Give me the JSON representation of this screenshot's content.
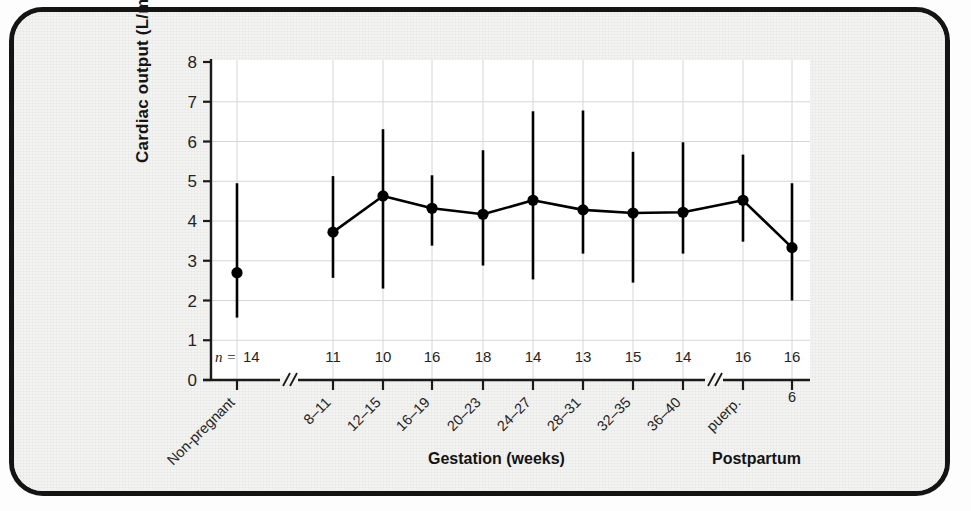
{
  "figure": {
    "frame_color": "#141414",
    "paper_color": "#f3f3f2",
    "plot_bg_color": "#ffffff",
    "grid_color": "#d6d6d6",
    "axis_color": "#1a1a1a",
    "marker_color": "#000000"
  },
  "chart_data": {
    "type": "line",
    "title": "",
    "xlabel": "Gestation (weeks)",
    "xlabel_secondary": "Postpartum",
    "ylabel": "Cardiac output (L/min)",
    "ylim": [
      0,
      8
    ],
    "yticks": [
      0,
      1,
      2,
      3,
      4,
      5,
      6,
      7,
      8
    ],
    "ytick_labels": [
      "0",
      "1",
      "2",
      "3",
      "4",
      "5",
      "6",
      "7",
      "8"
    ],
    "grid": true,
    "legend": "none",
    "error_bar_style": "range-line",
    "axis_breaks": [
      "between Non-pregnant and 8-11",
      "between 36-40 and puerp."
    ],
    "n_row_prefix": "n =",
    "categories": [
      "Non-pregnant",
      "8–11",
      "12–15",
      "16–19",
      "20–23",
      "24–27",
      "28–31",
      "32–35",
      "36–40",
      "puerp.",
      "6"
    ],
    "category_rotated": [
      true,
      true,
      true,
      true,
      true,
      true,
      true,
      true,
      true,
      true,
      false
    ],
    "n_values": [
      "14",
      "11",
      "10",
      "16",
      "18",
      "14",
      "13",
      "15",
      "14",
      "16",
      "16"
    ],
    "values": [
      2.7,
      3.72,
      4.63,
      4.32,
      4.17,
      4.52,
      4.28,
      4.2,
      4.22,
      4.52,
      3.33
    ],
    "lower": [
      1.57,
      2.57,
      2.3,
      3.38,
      2.88,
      2.53,
      3.18,
      2.45,
      3.18,
      3.48,
      2.0
    ],
    "upper": [
      4.95,
      5.13,
      6.31,
      5.15,
      5.78,
      6.76,
      6.78,
      5.74,
      5.98,
      5.67,
      4.95
    ],
    "connect_line_from_index": 1,
    "connect_line_to_index": 10,
    "groups": [
      {
        "name": "Non-pregnant",
        "indices": [
          0
        ]
      },
      {
        "name": "Gestation (weeks)",
        "indices": [
          1,
          2,
          3,
          4,
          5,
          6,
          7,
          8
        ]
      },
      {
        "name": "Postpartum",
        "indices": [
          9,
          10
        ]
      }
    ]
  }
}
